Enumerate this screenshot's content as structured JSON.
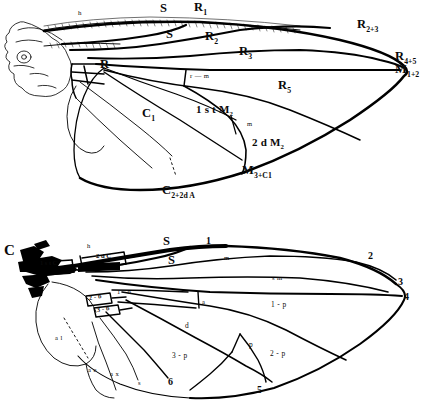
{
  "figure": {
    "ink_color": "#000000",
    "background_color": "#ffffff",
    "panels": [
      "upper-wing-vein-nomenclature",
      "lower-wing-cell-nomenclature"
    ]
  },
  "upper_wing": {
    "caption": "Upper wing: longitudinal veins labelled with Comstock-Needham notation",
    "labels": [
      {
        "id": "h",
        "text": "h",
        "style": "tiny",
        "x": 78,
        "y": 14
      },
      {
        "id": "S-upper",
        "text": "S",
        "style": "big",
        "x": 160,
        "y": 7
      },
      {
        "id": "R1",
        "text": "R",
        "sub": "1",
        "style": "big",
        "x": 196,
        "y": 6
      },
      {
        "id": "S-lower",
        "text": "S",
        "style": "big",
        "x": 166,
        "y": 32
      },
      {
        "id": "R2",
        "text": "R",
        "sub": "2",
        "style": "big",
        "x": 207,
        "y": 35
      },
      {
        "id": "R3",
        "text": "R",
        "sub": "3",
        "style": "big",
        "x": 240,
        "y": 50
      },
      {
        "id": "R2plus3",
        "text": "R",
        "sub": "2+3",
        "style": "big",
        "x": 358,
        "y": 23
      },
      {
        "id": "R4plus5",
        "text": "R",
        "sub": "4+5",
        "style": "big",
        "x": 396,
        "y": 55
      },
      {
        "id": "M1plus2",
        "text": "M",
        "sub": "1+2",
        "style": "big",
        "x": 396,
        "y": 68
      },
      {
        "id": "R",
        "text": "R",
        "style": "big",
        "x": 101,
        "y": 62
      },
      {
        "id": "R5",
        "text": "R",
        "sub": "5",
        "style": "big",
        "x": 279,
        "y": 84
      },
      {
        "id": "r-m",
        "text": "r — m",
        "style": "tiny",
        "x": 190,
        "y": 76
      },
      {
        "id": "C1",
        "text": "C",
        "sub": "1",
        "style": "big",
        "x": 143,
        "y": 112
      },
      {
        "id": "1stM2",
        "text": "1 s t M",
        "sub": "2",
        "style": "big",
        "x": 199,
        "y": 108
      },
      {
        "id": "m",
        "text": "m",
        "style": "tiny",
        "x": 247,
        "y": 124
      },
      {
        "id": "2dM2",
        "text": "2 d M",
        "sub": "2",
        "style": "big",
        "x": 254,
        "y": 141
      },
      {
        "id": "M3plusC1",
        "text": "M",
        "sub": "3+C1",
        "style": "big",
        "x": 243,
        "y": 168
      },
      {
        "id": "C2plus2dA",
        "text": "C",
        "sub": "2+2d A",
        "style": "big",
        "x": 163,
        "y": 188
      }
    ]
  },
  "lower_wing": {
    "caption": "Lower wing: cells of the wing numbered and named",
    "labels": [
      {
        "id": "C",
        "text": "C",
        "style": "big",
        "x": 6,
        "y": 249
      },
      {
        "id": "1stC",
        "text": "1 s t C",
        "style": "mid",
        "x": 40,
        "y": 264
      },
      {
        "id": "2dC",
        "text": "2 d C",
        "style": "mid",
        "x": 97,
        "y": 257
      },
      {
        "id": "h-low",
        "text": "h",
        "style": "tiny",
        "x": 87,
        "y": 247
      },
      {
        "id": "S-up-low",
        "text": "S",
        "style": "big",
        "x": 164,
        "y": 240
      },
      {
        "id": "one",
        "text": "1",
        "style": "num",
        "x": 206,
        "y": 240
      },
      {
        "id": "S-lo-low",
        "text": "S",
        "style": "big",
        "x": 169,
        "y": 259
      },
      {
        "id": "m-low",
        "text": "m",
        "style": "tiny",
        "x": 224,
        "y": 258
      },
      {
        "id": "two",
        "text": "2",
        "style": "num",
        "x": 369,
        "y": 255
      },
      {
        "id": "sm",
        "text": "s m",
        "style": "tiny",
        "x": 273,
        "y": 278
      },
      {
        "id": "three",
        "text": "3",
        "style": "num",
        "x": 399,
        "y": 281
      },
      {
        "id": "four",
        "text": "4",
        "style": "num",
        "x": 405,
        "y": 296
      },
      {
        "id": "1-b",
        "text": "1 - b",
        "style": "tiny",
        "x": 118,
        "y": 293
      },
      {
        "id": "2-b",
        "text": "2 - b",
        "style": "box",
        "x": 89,
        "y": 298
      },
      {
        "id": "3-b",
        "text": "3 - b",
        "style": "box",
        "x": 96,
        "y": 310
      },
      {
        "id": "a",
        "text": "a",
        "style": "tiny",
        "x": 202,
        "y": 302
      },
      {
        "id": "1-p",
        "text": "1 - p",
        "style": "tiny",
        "x": 273,
        "y": 305
      },
      {
        "id": "d",
        "text": "d",
        "style": "tiny",
        "x": 185,
        "y": 325
      },
      {
        "id": "p",
        "text": "p",
        "style": "tiny",
        "x": 249,
        "y": 344
      },
      {
        "id": "2-p",
        "text": "2 - p",
        "style": "tiny",
        "x": 271,
        "y": 354
      },
      {
        "id": "3-p",
        "text": "3 - p",
        "style": "tiny",
        "x": 173,
        "y": 355
      },
      {
        "id": "a-l",
        "text": "a l",
        "style": "tiny",
        "x": 55,
        "y": 338
      },
      {
        "id": "ae",
        "text": "a e",
        "style": "tiny",
        "x": 88,
        "y": 370
      },
      {
        "id": "ax",
        "text": "a x",
        "style": "tiny",
        "x": 111,
        "y": 374
      },
      {
        "id": "s-small",
        "text": "s",
        "style": "tiny",
        "x": 138,
        "y": 383
      },
      {
        "id": "six",
        "text": "6",
        "style": "num",
        "x": 169,
        "y": 381
      },
      {
        "id": "five",
        "text": "5",
        "style": "num",
        "x": 258,
        "y": 389
      }
    ]
  }
}
